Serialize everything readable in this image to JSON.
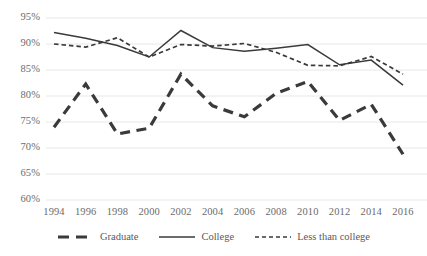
{
  "chart_data": {
    "type": "line",
    "title": "",
    "subtitle": "",
    "xlabel": "",
    "ylabel": "",
    "x": [
      1994,
      1996,
      1998,
      2000,
      2002,
      2004,
      2006,
      2008,
      2010,
      2012,
      2014,
      2016
    ],
    "xlim": [
      1994,
      2016
    ],
    "ylim": [
      60,
      95
    ],
    "ytick_values": [
      95,
      90,
      85,
      80,
      75,
      70,
      65,
      60
    ],
    "ytick_labels": [
      "95%",
      "90%",
      "85%",
      "80%",
      "75%",
      "70%",
      "65%",
      "60%"
    ],
    "xtick_labels": [
      "1994",
      "1996",
      "1998",
      "2000",
      "2002",
      "2004",
      "2006",
      "2008",
      "2010",
      "2012",
      "2014",
      "2016"
    ],
    "grid": true,
    "grid_axis": "y",
    "legend_position": "bottom",
    "series": [
      {
        "name": "Graduate",
        "style": "long-dash",
        "color": "#3a3a3a",
        "width": 3.2,
        "values": [
          74.0,
          82.3,
          72.7,
          73.8,
          84.2,
          78.1,
          76.0,
          80.5,
          82.8,
          75.3,
          78.4,
          68.8
        ]
      },
      {
        "name": "College",
        "style": "solid",
        "color": "#3a3a3a",
        "width": 1.5,
        "values": [
          92.2,
          91.1,
          89.7,
          87.5,
          92.6,
          89.3,
          88.6,
          89.2,
          89.9,
          86.0,
          86.9,
          82.1
        ]
      },
      {
        "name": "Less than college",
        "style": "short-dash",
        "color": "#3a3a3a",
        "width": 1.7,
        "values": [
          90.0,
          89.4,
          91.2,
          87.5,
          89.9,
          89.6,
          90.1,
          88.4,
          85.9,
          85.8,
          87.6,
          84.2
        ]
      }
    ]
  },
  "legend": {
    "items": [
      {
        "label": "Graduate",
        "swatch": "long-dash-swatch"
      },
      {
        "label": "College",
        "swatch": "solid-swatch"
      },
      {
        "label": "Less than college",
        "swatch": "short-dash-swatch"
      }
    ]
  },
  "colors": {
    "line": "#3a3a3a",
    "grid": "#e8e8e8",
    "tick_text": "#6b6b6b",
    "background": "#ffffff"
  }
}
